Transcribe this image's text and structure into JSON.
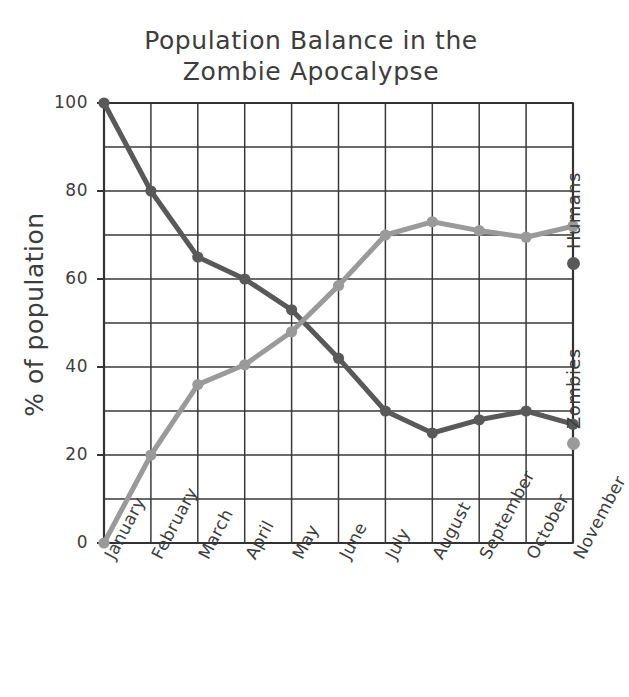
{
  "chart_data": {
    "type": "line",
    "title": "Population Balance in the Zombie Apocalypse",
    "title_lines": [
      "Population Balance in the",
      "Zombie Apocalypse"
    ],
    "xlabel": "",
    "ylabel": "% of population",
    "categories": [
      "January",
      "February",
      "March",
      "April",
      "May",
      "June",
      "July",
      "August",
      "September",
      "October",
      "November"
    ],
    "series": [
      {
        "name": "Humans",
        "color": "#595959",
        "values": [
          100,
          80,
          65,
          60,
          53,
          42,
          30,
          25,
          28,
          30,
          27
        ]
      },
      {
        "name": "Zombies",
        "color": "#9a9a9a",
        "values": [
          0,
          20,
          36,
          40.5,
          48,
          58.5,
          70,
          73,
          71,
          69.5,
          72
        ]
      }
    ],
    "ylim": [
      0,
      100
    ],
    "yticks": [
      0,
      20,
      40,
      60,
      80,
      100
    ],
    "ytick_labels": [
      "0",
      "20",
      "40",
      "60",
      "80",
      "100"
    ],
    "y_minor_step": 10,
    "grid": true,
    "legend_position": "right-outside-rotated",
    "legend": [
      {
        "label": "Humans",
        "color": "#595959",
        "marker": "circle"
      },
      {
        "label": "Zombies",
        "color": "#9a9a9a",
        "marker": "circle"
      }
    ],
    "style": "hand-drawn-sketch",
    "axis_color": "#333333",
    "grid_color": "#3a3a3a",
    "background": "#ffffff"
  }
}
